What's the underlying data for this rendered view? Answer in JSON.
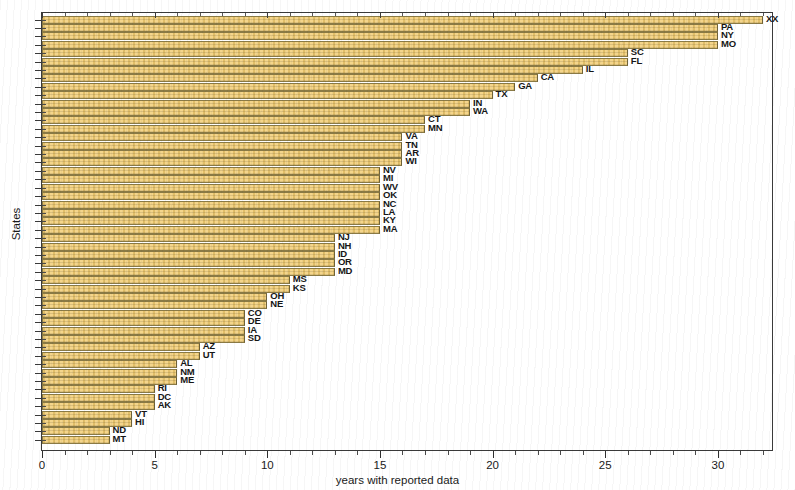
{
  "chart_data": {
    "type": "bar",
    "orientation": "horizontal",
    "title": "",
    "xlabel": "years with reported data",
    "ylabel": "States",
    "xlim": [
      0,
      32.4
    ],
    "xticks": [
      0,
      5,
      10,
      15,
      20,
      25,
      30
    ],
    "xticklabels": [
      "0",
      "5",
      "10",
      "15",
      "20",
      "25",
      "30"
    ],
    "grid": false,
    "legend": null,
    "bar_color": "#f2cc72",
    "bar_edge_color": "#8a7a45",
    "categories": [
      "XX",
      "PA",
      "NY",
      "MO",
      "SC",
      "FL",
      "IL",
      "CA",
      "GA",
      "TX",
      "IN",
      "WA",
      "CT",
      "MN",
      "VA",
      "TN",
      "AR",
      "WI",
      "NV",
      "MI",
      "WV",
      "OK",
      "NC",
      "LA",
      "KY",
      "MA",
      "NJ",
      "NH",
      "ID",
      "OR",
      "MD",
      "MS",
      "KS",
      "OH",
      "NE",
      "CO",
      "DE",
      "IA",
      "SD",
      "AZ",
      "UT",
      "AL",
      "NM",
      "ME",
      "RI",
      "DC",
      "AK",
      "VT",
      "HI",
      "ND",
      "MT"
    ],
    "values": [
      32,
      30,
      30,
      30,
      26,
      26,
      24,
      22,
      21,
      20,
      19,
      19,
      17,
      17,
      16,
      16,
      16,
      16,
      15,
      15,
      15,
      15,
      15,
      15,
      15,
      15,
      13,
      13,
      13,
      13,
      13,
      11,
      11,
      10,
      10,
      9,
      9,
      9,
      9,
      7,
      7,
      6,
      6,
      6,
      5,
      5,
      5,
      4,
      4,
      3,
      3
    ],
    "n_bars": 51
  },
  "axes": {
    "x_title": "years with reported data",
    "y_title": "States"
  }
}
